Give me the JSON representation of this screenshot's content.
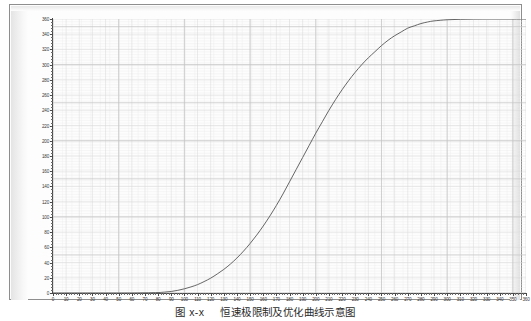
{
  "figure": {
    "caption_number": "图 x-x",
    "caption_text": "恒速极限制及优化曲线示意图"
  },
  "chart_data": {
    "type": "line",
    "title": "",
    "xlabel": "",
    "ylabel": "",
    "xlim": [
      0,
      360
    ],
    "ylim": [
      0,
      360
    ],
    "grid": true,
    "legend": "none",
    "x_ticks": [
      0,
      10,
      20,
      30,
      40,
      50,
      60,
      70,
      80,
      90,
      100,
      110,
      120,
      130,
      140,
      150,
      160,
      170,
      180,
      190,
      200,
      210,
      220,
      230,
      240,
      250,
      260,
      270,
      280,
      290,
      300,
      310,
      320,
      330,
      340,
      350,
      360
    ],
    "y_ticks": [
      0,
      20,
      40,
      60,
      80,
      100,
      120,
      140,
      160,
      180,
      200,
      220,
      240,
      260,
      280,
      300,
      320,
      340,
      360
    ],
    "line_color": "#555555",
    "series": [
      {
        "name": "S-curve",
        "x": [
          0,
          10,
          20,
          30,
          40,
          50,
          60,
          70,
          80,
          85,
          90,
          95,
          100,
          105,
          110,
          115,
          120,
          125,
          130,
          135,
          140,
          145,
          150,
          155,
          160,
          165,
          170,
          175,
          180,
          185,
          190,
          195,
          200,
          205,
          210,
          215,
          220,
          225,
          230,
          235,
          240,
          245,
          250,
          255,
          260,
          265,
          270,
          275,
          280,
          285,
          290,
          300,
          310,
          320,
          330,
          340,
          350,
          360
        ],
        "values": [
          0,
          0,
          0,
          0,
          0,
          0,
          0,
          0.2,
          0.6,
          1.2,
          2,
          3.5,
          5.5,
          8,
          11,
          15,
          19.5,
          25,
          31,
          38,
          46,
          55,
          65,
          76,
          88,
          101,
          115,
          130,
          146,
          162,
          178,
          194,
          210,
          225,
          240,
          254,
          267,
          279,
          290,
          300,
          309,
          317,
          325,
          332,
          338,
          343,
          348,
          351,
          354,
          356,
          357.5,
          359,
          359.6,
          359.9,
          360,
          360,
          360,
          360
        ]
      }
    ]
  }
}
